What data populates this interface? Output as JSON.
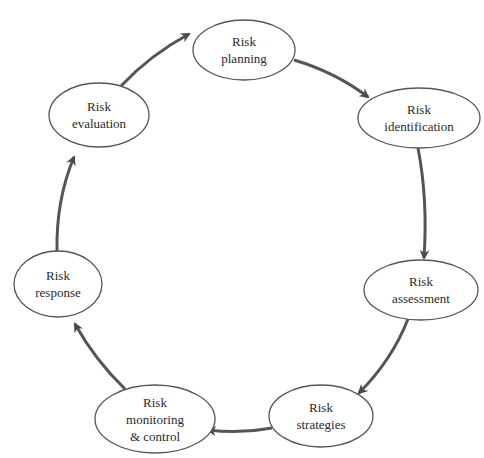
{
  "diagram": {
    "type": "cycle",
    "colors": {
      "stroke": "#555555",
      "arrow": "#4a4a4a",
      "text": "#2a2a2a",
      "background": "#ffffff"
    },
    "nodes": [
      {
        "id": "planning",
        "lines": [
          "Risk",
          "planning"
        ],
        "cx": 244,
        "cy": 50,
        "rx": 51,
        "ry": 30
      },
      {
        "id": "identification",
        "lines": [
          "Risk",
          "identification"
        ],
        "cx": 419,
        "cy": 118,
        "rx": 61,
        "ry": 30
      },
      {
        "id": "assessment",
        "lines": [
          "Risk",
          "assessment"
        ],
        "cx": 421,
        "cy": 290,
        "rx": 57,
        "ry": 30
      },
      {
        "id": "strategies",
        "lines": [
          "Risk",
          "strategies"
        ],
        "cx": 321,
        "cy": 416,
        "rx": 52,
        "ry": 31
      },
      {
        "id": "monitoring",
        "lines": [
          "Risk",
          "monitoring",
          "& control"
        ],
        "cx": 155,
        "cy": 419,
        "rx": 60,
        "ry": 34
      },
      {
        "id": "response",
        "lines": [
          "Risk",
          "response"
        ],
        "cx": 58,
        "cy": 284,
        "rx": 44,
        "ry": 33
      },
      {
        "id": "evaluation",
        "lines": [
          "Risk",
          "evaluation"
        ],
        "cx": 99,
        "cy": 115,
        "rx": 50,
        "ry": 32
      }
    ],
    "edges": [
      {
        "from": "planning",
        "to": "identification"
      },
      {
        "from": "identification",
        "to": "assessment"
      },
      {
        "from": "assessment",
        "to": "strategies"
      },
      {
        "from": "strategies",
        "to": "monitoring"
      },
      {
        "from": "monitoring",
        "to": "response"
      },
      {
        "from": "response",
        "to": "evaluation"
      },
      {
        "from": "evaluation",
        "to": "planning"
      }
    ]
  }
}
